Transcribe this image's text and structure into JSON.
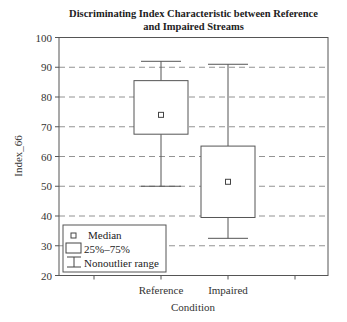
{
  "chart_data": {
    "type": "boxplot",
    "title": "Discriminating Index Characteristic between Reference and Impaired Streams",
    "title_lines": [
      "Discriminating Index Characteristic between Reference",
      "and Impaired Streams"
    ],
    "xlabel": "Condition",
    "ylabel": "Index_66",
    "ylim": [
      20,
      100
    ],
    "yticks": [
      20,
      30,
      40,
      50,
      60,
      70,
      80,
      90,
      100
    ],
    "grid": "horizontal dashed",
    "categories": [
      "Reference",
      "Impaired"
    ],
    "series": [
      {
        "name": "Reference",
        "median": 74,
        "q1": 67.5,
        "q3": 85.5,
        "whisker_low": 50,
        "whisker_high": 92
      },
      {
        "name": "Impaired",
        "median": 51.5,
        "q1": 39.5,
        "q3": 63.5,
        "whisker_low": 32.5,
        "whisker_high": 91
      }
    ],
    "legend": {
      "position": "lower left",
      "entries": [
        "Median",
        "25%–75%",
        "Nonoutlier range"
      ]
    }
  }
}
